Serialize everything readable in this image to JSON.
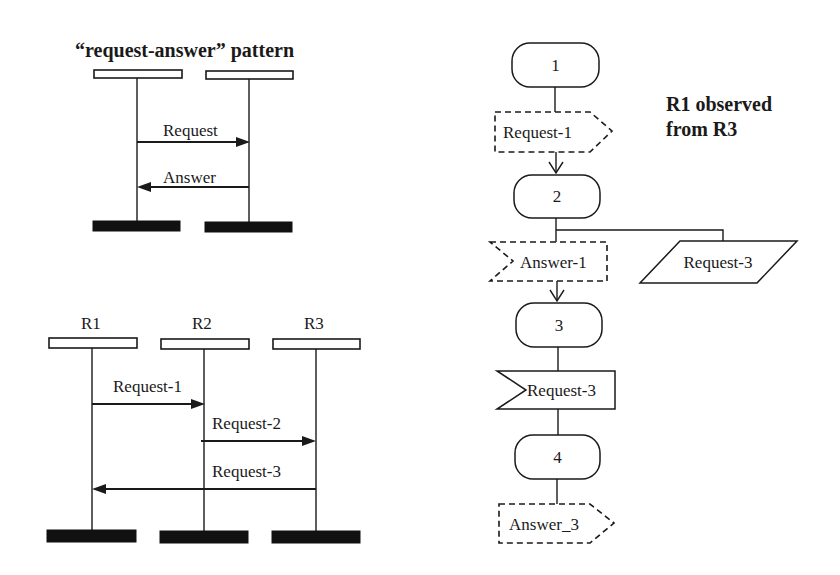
{
  "top_diagram": {
    "title": "“request-answer” pattern",
    "messages": [
      {
        "label": "Request",
        "direction": "left-to-right"
      },
      {
        "label": "Answer",
        "direction": "right-to-left"
      }
    ]
  },
  "bottom_diagram": {
    "lifelines": [
      "R1",
      "R2",
      "R3"
    ],
    "messages": [
      {
        "label": "Request-1",
        "from": "R1",
        "to": "R2"
      },
      {
        "label": "Request-2",
        "from": "R2",
        "to": "R3"
      },
      {
        "label": "Request-3",
        "from": "R3",
        "to": "R1"
      }
    ]
  },
  "flowchart": {
    "title_line1": "R1 observed",
    "title_line2": "from R3",
    "states": [
      "1",
      "2",
      "3",
      "4"
    ],
    "signals": {
      "request_1": "Request-1",
      "answer_1": "Answer-1",
      "request_3_out": "Request-3",
      "request_3_in": "Request-3",
      "answer_3": "Answer_3"
    }
  },
  "colors": {
    "ink": "#1a1a1a",
    "background": "#ffffff"
  }
}
